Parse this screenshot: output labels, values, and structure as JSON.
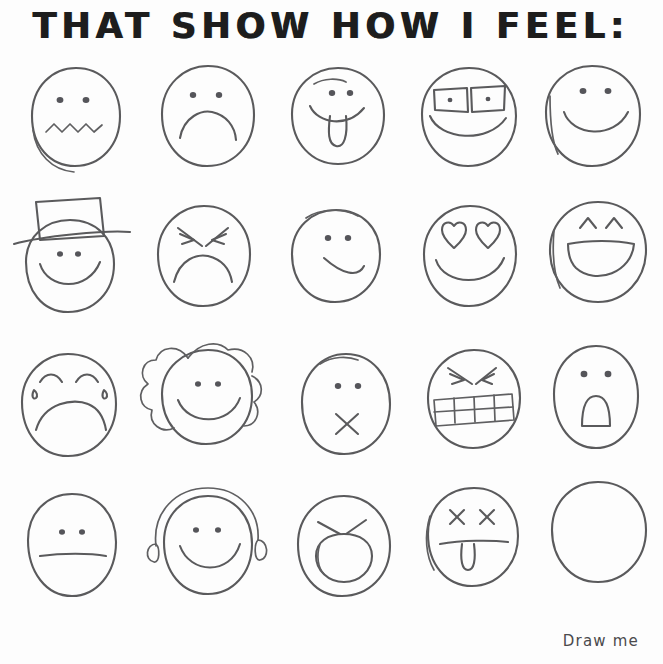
{
  "sheet": {
    "title": "THAT SHOW HOW I FEEL:",
    "caption": "Draw me",
    "ink_color": "#5a5a5c",
    "paper_color": "#fdfdfd",
    "title_color": "#161616",
    "columns": 5,
    "rows": 4
  },
  "faces": [
    {
      "index": 1,
      "row": 1,
      "col": 1,
      "name": "worried-face",
      "label": "Worried",
      "eyes": "dots",
      "mouth": "squiggle"
    },
    {
      "index": 2,
      "row": 1,
      "col": 2,
      "name": "sad-face",
      "label": "Sad",
      "eyes": "dots",
      "mouth": "frown"
    },
    {
      "index": 3,
      "row": 1,
      "col": 3,
      "name": "tongue-out-face",
      "label": "Silly",
      "eyes": "dots",
      "mouth": "smile-tongue"
    },
    {
      "index": 4,
      "row": 1,
      "col": 4,
      "name": "glasses-face",
      "label": "Smart",
      "eyes": "glasses",
      "mouth": "wide-smile"
    },
    {
      "index": 5,
      "row": 1,
      "col": 5,
      "name": "happy-face",
      "label": "Happy",
      "eyes": "dots",
      "mouth": "smile"
    },
    {
      "index": 6,
      "row": 2,
      "col": 1,
      "name": "top-hat-face",
      "label": "Fancy",
      "eyes": "dots",
      "mouth": "smile",
      "accessory": "top-hat"
    },
    {
      "index": 7,
      "row": 2,
      "col": 2,
      "name": "angry-face",
      "label": "Angry",
      "eyes": "angry-brows",
      "mouth": "frown"
    },
    {
      "index": 8,
      "row": 2,
      "col": 3,
      "name": "smirk-face",
      "label": "Smirk",
      "eyes": "dots",
      "mouth": "half-smile"
    },
    {
      "index": 9,
      "row": 2,
      "col": 4,
      "name": "heart-eyes-face",
      "label": "In love",
      "eyes": "hearts",
      "mouth": "smile"
    },
    {
      "index": 10,
      "row": 2,
      "col": 5,
      "name": "laughing-face",
      "label": "Laughing",
      "eyes": "carets",
      "mouth": "open-laugh"
    },
    {
      "index": 11,
      "row": 3,
      "col": 1,
      "name": "crying-face",
      "label": "Crying",
      "eyes": "closed-arcs",
      "mouth": "big-frown",
      "accessory": "tears"
    },
    {
      "index": 12,
      "row": 3,
      "col": 2,
      "name": "curly-hair-face",
      "label": "Curly hair",
      "eyes": "dots",
      "mouth": "smile",
      "accessory": "curly-hair"
    },
    {
      "index": 13,
      "row": 3,
      "col": 3,
      "name": "x-mouth-face",
      "label": "Speechless",
      "eyes": "dots",
      "mouth": "x"
    },
    {
      "index": 14,
      "row": 3,
      "col": 4,
      "name": "gritted-teeth-face",
      "label": "Frustrated",
      "eyes": "angry-brows",
      "mouth": "gritted-teeth"
    },
    {
      "index": 15,
      "row": 3,
      "col": 5,
      "name": "shocked-face",
      "label": "Shocked",
      "eyes": "dots",
      "mouth": "oval-open"
    },
    {
      "index": 16,
      "row": 4,
      "col": 1,
      "name": "neutral-face",
      "label": "Neutral",
      "eyes": "dots",
      "mouth": "flat-line"
    },
    {
      "index": 17,
      "row": 4,
      "col": 2,
      "name": "headphones-face",
      "label": "Listening",
      "eyes": "dots",
      "mouth": "smile",
      "accessory": "headphones-music-note"
    },
    {
      "index": 18,
      "row": 4,
      "col": 3,
      "name": "shouting-face",
      "label": "Shouting",
      "eyes": "angry-brows",
      "mouth": "big-oval"
    },
    {
      "index": 19,
      "row": 4,
      "col": 4,
      "name": "dead-face",
      "label": "Dead",
      "eyes": "x-eyes",
      "mouth": "line-tongue"
    },
    {
      "index": 20,
      "row": 4,
      "col": 5,
      "name": "blank-face",
      "label": "Blank",
      "eyes": "none",
      "mouth": "none"
    }
  ]
}
